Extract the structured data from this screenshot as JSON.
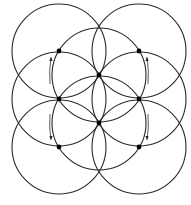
{
  "diagram": {
    "width": 191,
    "height": 205,
    "stroke_color": "#2a2a2a",
    "dot_color": "#000000",
    "radius": 47,
    "circles": [
      {
        "id": "top-left",
        "cx": 59,
        "cy": 51
      },
      {
        "id": "top-right",
        "cx": 139,
        "cy": 51
      },
      {
        "id": "center-upper",
        "cx": 99,
        "cy": 75
      },
      {
        "id": "mid-left",
        "cx": 59,
        "cy": 99
      },
      {
        "id": "mid-right",
        "cx": 139,
        "cy": 99
      },
      {
        "id": "center-lower",
        "cx": 99,
        "cy": 123
      },
      {
        "id": "bottom-left",
        "cx": 59,
        "cy": 147
      },
      {
        "id": "bottom-right",
        "cx": 139,
        "cy": 147
      }
    ],
    "points": [
      {
        "id": "p-upper-left",
        "x": 59,
        "y": 51
      },
      {
        "id": "p-upper-right",
        "x": 139,
        "y": 51
      },
      {
        "id": "p-center-upper",
        "x": 99,
        "y": 75
      },
      {
        "id": "p-mid-left",
        "x": 59,
        "y": 99
      },
      {
        "id": "p-mid-right",
        "x": 139,
        "y": 99
      },
      {
        "id": "p-center-lower",
        "x": 99,
        "y": 123
      },
      {
        "id": "p-lower-left",
        "x": 59,
        "y": 147
      },
      {
        "id": "p-lower-right",
        "x": 139,
        "y": 147
      }
    ],
    "arrows": [
      {
        "id": "arrow-upper-left",
        "direction": "up",
        "from": [
          50,
          84
        ],
        "to": [
          51,
          57
        ]
      },
      {
        "id": "arrow-lower-left",
        "direction": "down",
        "from": [
          50,
          114
        ],
        "to": [
          51,
          140
        ]
      },
      {
        "id": "arrow-upper-right",
        "direction": "up",
        "from": [
          148,
          84
        ],
        "to": [
          147,
          57
        ]
      },
      {
        "id": "arrow-lower-right",
        "direction": "down",
        "from": [
          148,
          114
        ],
        "to": [
          147,
          140
        ]
      }
    ]
  }
}
